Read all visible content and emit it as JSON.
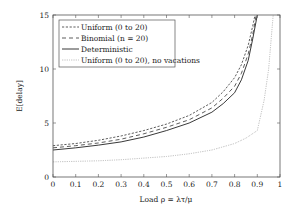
{
  "chart_data": {
    "type": "line",
    "title": "",
    "xlabel": "Load ρ = λτ/μ",
    "ylabel": "E[delay]",
    "xlim": [
      0,
      1
    ],
    "ylim": [
      0,
      15
    ],
    "xticks": [
      0,
      0.1,
      0.2,
      0.3,
      0.4,
      0.5,
      0.6,
      0.7,
      0.8,
      0.9,
      1
    ],
    "xtick_labels": [
      "0",
      "0.1",
      "0.2",
      "0.3",
      "0.4",
      "0.5",
      "0.6",
      "0.7",
      "0.8",
      "0.9",
      "1"
    ],
    "yticks": [
      0,
      5,
      10,
      15
    ],
    "ytick_labels": [
      "0",
      "5",
      "10",
      "15"
    ],
    "grid": false,
    "legend_position": "top-left",
    "series": [
      {
        "name": "Uniform (0 to 20)",
        "style": "dashed-short",
        "color": "#333333",
        "x": [
          0,
          0.1,
          0.2,
          0.3,
          0.4,
          0.5,
          0.6,
          0.7,
          0.75,
          0.8,
          0.83,
          0.86,
          0.88,
          0.89
        ],
        "y": [
          2.9,
          3.1,
          3.4,
          3.8,
          4.3,
          4.9,
          5.7,
          6.9,
          7.9,
          9.2,
          10.4,
          12.2,
          14.0,
          15.0
        ]
      },
      {
        "name": "Binomial (n = 20)",
        "style": "dashed-long",
        "color": "#333333",
        "x": [
          0,
          0.1,
          0.2,
          0.3,
          0.4,
          0.5,
          0.6,
          0.7,
          0.75,
          0.8,
          0.83,
          0.86,
          0.88,
          0.895
        ],
        "y": [
          2.7,
          2.9,
          3.15,
          3.5,
          4.0,
          4.6,
          5.3,
          6.4,
          7.3,
          8.4,
          9.6,
          11.4,
          13.2,
          15.0
        ]
      },
      {
        "name": "Deterministic",
        "style": "solid",
        "color": "#222222",
        "x": [
          0,
          0.1,
          0.2,
          0.3,
          0.4,
          0.5,
          0.6,
          0.7,
          0.75,
          0.8,
          0.83,
          0.86,
          0.88,
          0.9
        ],
        "y": [
          2.5,
          2.7,
          2.95,
          3.25,
          3.7,
          4.3,
          5.0,
          6.0,
          6.8,
          7.8,
          9.0,
          10.8,
          12.8,
          15.0
        ]
      },
      {
        "name": "Uniform (0 to 20), no vacations",
        "style": "dotted",
        "color": "#888888",
        "x": [
          0,
          0.1,
          0.2,
          0.3,
          0.4,
          0.5,
          0.6,
          0.7,
          0.8,
          0.85,
          0.9,
          0.93,
          0.95,
          0.97
        ],
        "y": [
          1.4,
          1.45,
          1.5,
          1.6,
          1.75,
          1.9,
          2.15,
          2.5,
          3.1,
          3.6,
          4.3,
          7.1,
          10.0,
          15.0
        ]
      }
    ]
  }
}
